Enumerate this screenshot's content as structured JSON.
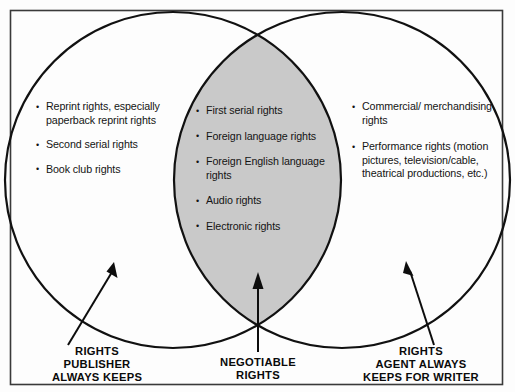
{
  "diagram": {
    "type": "venn",
    "colors": {
      "overlap_fill": "#c9c9c9",
      "circle_stroke": "#111111",
      "frame_stroke": "#3a3a3a",
      "text": "#141414",
      "background": "#fdfdfd"
    },
    "regions": {
      "left": {
        "name": "rights-publisher-always-keeps",
        "caption_lines": [
          "RIGHTS",
          "PUBLISHER",
          "ALWAYS KEEPS"
        ],
        "items": [
          "Reprint rights, especially paperback reprint rights",
          "Second serial rights",
          "Book club rights"
        ]
      },
      "overlap": {
        "name": "negotiable-rights",
        "caption_lines": [
          "NEGOTIABLE",
          "RIGHTS"
        ],
        "items": [
          "First serial rights",
          "Foreign language rights",
          "Foreign English language rights",
          "Audio rights",
          "Electronic rights"
        ]
      },
      "right": {
        "name": "rights-agent-always-keeps-for-writer",
        "caption_lines": [
          "RIGHTS",
          "AGENT ALWAYS",
          "KEEPS FOR WRITER"
        ],
        "items": [
          "Commercial/ merchandising rights",
          "Performance rights (motion pictures, television/cable, theatrical productions, etc.)"
        ]
      }
    },
    "arrows": [
      {
        "name": "arrow-to-left-region",
        "direction": "up-right"
      },
      {
        "name": "arrow-to-overlap-region",
        "direction": "up"
      },
      {
        "name": "arrow-to-right-region",
        "direction": "up-left"
      }
    ]
  }
}
